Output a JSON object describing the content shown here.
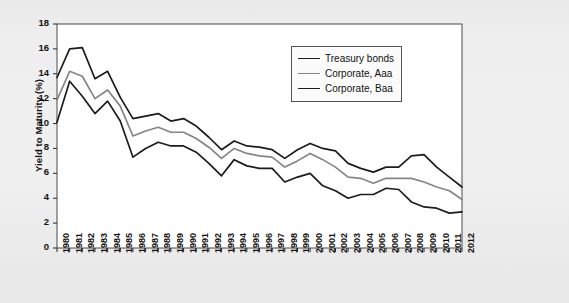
{
  "chart_data": {
    "type": "line",
    "title": "",
    "xlabel": "",
    "ylabel": "Yield to Maturity (%)",
    "ylim": [
      0,
      18
    ],
    "ytick_step": 2,
    "yticks": [
      "18",
      "16",
      "14",
      "12",
      "10",
      "8",
      "6",
      "4",
      "2",
      "0"
    ],
    "grid": false,
    "legend_position": "top-right-inside",
    "categories": [
      "1980",
      "1981",
      "1982",
      "1983",
      "1984",
      "1985",
      "1986",
      "1987",
      "1988",
      "1989",
      "1990",
      "1991",
      "1992",
      "1993",
      "1994",
      "1995",
      "1996",
      "1997",
      "1998",
      "1999",
      "2000",
      "2001",
      "2002",
      "2003",
      "2004",
      "2005",
      "2006",
      "2007",
      "2008",
      "2009",
      "2010",
      "2011",
      "2012"
    ],
    "series": [
      {
        "name": "Treasury bonds",
        "color": "#1c1c1c",
        "values": [
          10.1,
          13.4,
          12.2,
          10.8,
          11.8,
          10.2,
          7.3,
          8.0,
          8.5,
          8.2,
          8.2,
          7.7,
          6.8,
          5.8,
          7.1,
          6.6,
          6.4,
          6.4,
          5.3,
          5.7,
          6.0,
          5.0,
          4.6,
          4.0,
          4.3,
          4.3,
          4.8,
          4.7,
          3.7,
          3.3,
          3.2,
          2.8,
          2.9
        ]
      },
      {
        "name": "Corporate, Aaa",
        "color": "#858585",
        "values": [
          11.9,
          14.2,
          13.8,
          12.0,
          12.7,
          11.4,
          9.0,
          9.4,
          9.7,
          9.3,
          9.3,
          8.8,
          8.1,
          7.2,
          8.0,
          7.6,
          7.4,
          7.3,
          6.5,
          7.0,
          7.6,
          7.1,
          6.5,
          5.7,
          5.6,
          5.2,
          5.6,
          5.6,
          5.6,
          5.3,
          4.9,
          4.6,
          3.9
        ]
      },
      {
        "name": "Corporate, Baa",
        "color": "#1c1c1c",
        "values": [
          13.7,
          16.0,
          16.1,
          13.6,
          14.2,
          12.1,
          10.4,
          10.6,
          10.8,
          10.2,
          10.4,
          9.8,
          8.9,
          7.9,
          8.6,
          8.2,
          8.1,
          7.9,
          7.2,
          7.9,
          8.4,
          8.0,
          7.8,
          6.8,
          6.4,
          6.1,
          6.5,
          6.5,
          7.4,
          7.5,
          6.5,
          5.7,
          4.9
        ]
      }
    ]
  },
  "legend": {
    "items": [
      {
        "label": "Treasury bonds",
        "color": "#1c1c1c",
        "thickness": "1.8px"
      },
      {
        "label": "Corporate, Aaa",
        "color": "#858585",
        "thickness": "1.8px"
      },
      {
        "label": "Corporate, Baa",
        "color": "#1c1c1c",
        "thickness": "1.8px"
      }
    ]
  }
}
